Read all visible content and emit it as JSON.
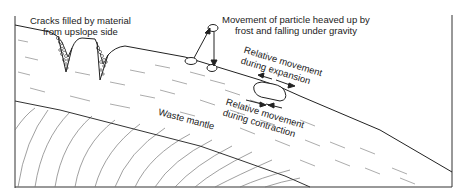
{
  "diagram": {
    "labels": {
      "cracks_line1": "Cracks filled by material",
      "cracks_line2": "from upslope side",
      "particle_line1": "Movement of particle heaved up by",
      "particle_line2": "frost and falling under gravity",
      "expansion_line1": "Relative movement",
      "expansion_line2": "during expansion",
      "contraction_line1": "Relative movement",
      "contraction_line2": "during contraction",
      "waste_mantle": "Waste mantle"
    },
    "colors": {
      "line": "#222222",
      "hatch": "#888888",
      "background": "#ffffff"
    }
  }
}
